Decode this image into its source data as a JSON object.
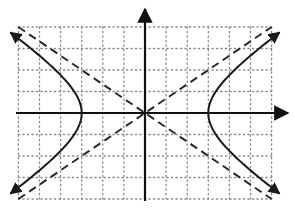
{
  "chart_data": {
    "type": "line",
    "title": "",
    "xlabel": "",
    "ylabel": "",
    "grid": true,
    "grid_style": "dotted",
    "xlim": [
      -6,
      6
    ],
    "ylim": [
      -4,
      4
    ],
    "x_ticks": [
      -6,
      -5,
      -4,
      -3,
      -2,
      -1,
      0,
      1,
      2,
      3,
      4,
      5,
      6
    ],
    "y_ticks": [
      -4,
      -3,
      -2,
      -1,
      0,
      1,
      2,
      3,
      4
    ],
    "tick_labels_shown": false,
    "center": [
      0,
      0
    ],
    "vertices": [
      [
        -3,
        0
      ],
      [
        3,
        0
      ]
    ],
    "a": 3,
    "b": 2,
    "series": [
      {
        "name": "hyperbola-left-branch",
        "style": "solid",
        "arrows": "both",
        "points": [
          [
            -6,
            3.46
          ],
          [
            -5,
            2.67
          ],
          [
            -4,
            1.76
          ],
          [
            -3.5,
            1.2
          ],
          [
            -3,
            0
          ],
          [
            -3.5,
            -1.2
          ],
          [
            -4,
            -1.76
          ],
          [
            -5,
            -2.67
          ],
          [
            -6,
            -3.46
          ]
        ]
      },
      {
        "name": "hyperbola-right-branch",
        "style": "solid",
        "arrows": "both",
        "points": [
          [
            6,
            3.46
          ],
          [
            5,
            2.67
          ],
          [
            4,
            1.76
          ],
          [
            3.5,
            1.2
          ],
          [
            3,
            0
          ],
          [
            3.5,
            -1.2
          ],
          [
            4,
            -1.76
          ],
          [
            5,
            -2.67
          ],
          [
            6,
            -3.46
          ]
        ]
      },
      {
        "name": "asymptote-positive-slope",
        "style": "dashed",
        "equation": "y = (2/3)x",
        "points": [
          [
            -6,
            -4
          ],
          [
            6,
            4
          ]
        ]
      },
      {
        "name": "asymptote-negative-slope",
        "style": "dashed",
        "equation": "y = -(2/3)x",
        "points": [
          [
            -6,
            4
          ],
          [
            6,
            -4
          ]
        ]
      }
    ],
    "axes": {
      "x_arrow": "right",
      "y_arrow": "up"
    },
    "colors": {
      "curve": "#1a1a1a",
      "axes": "#111111",
      "grid": "#8a8a8a",
      "background": "#ffffff"
    }
  }
}
